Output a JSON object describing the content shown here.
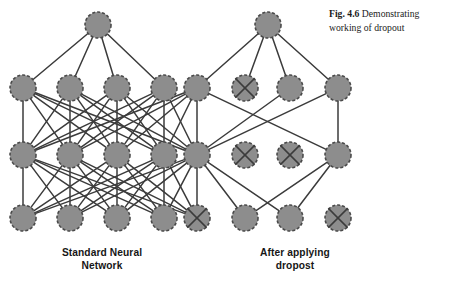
{
  "figure": {
    "caption_label": "Fig. 4.6",
    "caption_text": "Demonstrating working of dropout",
    "left_network_label_line1": "Standard Neural",
    "left_network_label_line2": "Network",
    "right_network_label_line1": "After applying",
    "right_network_label_line2": "dropost"
  },
  "style": {
    "node_fill": "#8d8d8d",
    "node_stroke": "#4a4a4a",
    "edge_color": "#3b3b3b",
    "cross_color": "#3b3b3b",
    "background": "#ffffff",
    "node_radius": 13,
    "node_stroke_width": 1.6,
    "node_dash": "3,2",
    "edge_width": 1.5
  },
  "diagram": {
    "type": "neural-network-dropout",
    "layer_y": {
      "output": 25,
      "hidden2": 88,
      "hidden1": 155,
      "input": 218
    },
    "column_x": [
      23,
      70,
      117,
      164,
      197,
      245,
      290,
      338
    ],
    "nodes": [
      {
        "id": "L-out-1",
        "net": "left",
        "layer": "output",
        "x": 98,
        "y": 25,
        "dropped": false
      },
      {
        "id": "R-out-1",
        "net": "right",
        "layer": "output",
        "x": 268,
        "y": 25,
        "dropped": false
      },
      {
        "id": "L-h2-1",
        "net": "left",
        "layer": "hidden2",
        "x": 23,
        "y": 88,
        "dropped": false
      },
      {
        "id": "L-h2-2",
        "net": "left",
        "layer": "hidden2",
        "x": 70,
        "y": 88,
        "dropped": false
      },
      {
        "id": "L-h2-3",
        "net": "left",
        "layer": "hidden2",
        "x": 117,
        "y": 88,
        "dropped": false
      },
      {
        "id": "L-h2-4",
        "net": "left",
        "layer": "hidden2",
        "x": 164,
        "y": 88,
        "dropped": false
      },
      {
        "id": "S-h2-5",
        "net": "shared",
        "layer": "hidden2",
        "x": 197,
        "y": 88,
        "dropped": false
      },
      {
        "id": "R-h2-2",
        "net": "right",
        "layer": "hidden2",
        "x": 245,
        "y": 88,
        "dropped": true
      },
      {
        "id": "R-h2-3",
        "net": "right",
        "layer": "hidden2",
        "x": 290,
        "y": 88,
        "dropped": false
      },
      {
        "id": "R-h2-4",
        "net": "right",
        "layer": "hidden2",
        "x": 338,
        "y": 88,
        "dropped": false
      },
      {
        "id": "L-h1-1",
        "net": "left",
        "layer": "hidden1",
        "x": 23,
        "y": 155,
        "dropped": false
      },
      {
        "id": "L-h1-2",
        "net": "left",
        "layer": "hidden1",
        "x": 70,
        "y": 155,
        "dropped": false
      },
      {
        "id": "L-h1-3",
        "net": "left",
        "layer": "hidden1",
        "x": 117,
        "y": 155,
        "dropped": false
      },
      {
        "id": "L-h1-4",
        "net": "left",
        "layer": "hidden1",
        "x": 164,
        "y": 155,
        "dropped": false
      },
      {
        "id": "S-h1-5",
        "net": "shared",
        "layer": "hidden1",
        "x": 197,
        "y": 155,
        "dropped": false
      },
      {
        "id": "R-h1-2",
        "net": "right",
        "layer": "hidden1",
        "x": 245,
        "y": 155,
        "dropped": true
      },
      {
        "id": "R-h1-3",
        "net": "right",
        "layer": "hidden1",
        "x": 290,
        "y": 155,
        "dropped": true
      },
      {
        "id": "R-h1-4",
        "net": "right",
        "layer": "hidden1",
        "x": 338,
        "y": 155,
        "dropped": false
      },
      {
        "id": "L-in-1",
        "net": "left",
        "layer": "input",
        "x": 23,
        "y": 218,
        "dropped": false
      },
      {
        "id": "L-in-2",
        "net": "left",
        "layer": "input",
        "x": 70,
        "y": 218,
        "dropped": false
      },
      {
        "id": "L-in-3",
        "net": "left",
        "layer": "input",
        "x": 117,
        "y": 218,
        "dropped": false
      },
      {
        "id": "L-in-4",
        "net": "left",
        "layer": "input",
        "x": 164,
        "y": 218,
        "dropped": false
      },
      {
        "id": "S-in-5",
        "net": "shared",
        "layer": "input",
        "x": 197,
        "y": 218,
        "dropped": true
      },
      {
        "id": "R-in-2",
        "net": "right",
        "layer": "input",
        "x": 245,
        "y": 218,
        "dropped": false
      },
      {
        "id": "R-in-3",
        "net": "right",
        "layer": "input",
        "x": 290,
        "y": 218,
        "dropped": false
      },
      {
        "id": "R-in-4",
        "net": "right",
        "layer": "input",
        "x": 338,
        "y": 218,
        "dropped": true
      }
    ],
    "edges": [
      [
        "L-out-1",
        "L-h2-1"
      ],
      [
        "L-out-1",
        "L-h2-2"
      ],
      [
        "L-out-1",
        "L-h2-3"
      ],
      [
        "L-out-1",
        "L-h2-4"
      ],
      [
        "L-h2-1",
        "L-h1-1"
      ],
      [
        "L-h2-1",
        "L-h1-2"
      ],
      [
        "L-h2-1",
        "L-h1-3"
      ],
      [
        "L-h2-1",
        "L-h1-4"
      ],
      [
        "L-h2-1",
        "S-h1-5"
      ],
      [
        "L-h2-2",
        "L-h1-1"
      ],
      [
        "L-h2-2",
        "L-h1-2"
      ],
      [
        "L-h2-2",
        "L-h1-3"
      ],
      [
        "L-h2-2",
        "L-h1-4"
      ],
      [
        "L-h2-2",
        "S-h1-5"
      ],
      [
        "L-h2-3",
        "L-h1-1"
      ],
      [
        "L-h2-3",
        "L-h1-2"
      ],
      [
        "L-h2-3",
        "L-h1-3"
      ],
      [
        "L-h2-3",
        "L-h1-4"
      ],
      [
        "L-h2-3",
        "S-h1-5"
      ],
      [
        "L-h2-4",
        "L-h1-1"
      ],
      [
        "L-h2-4",
        "L-h1-2"
      ],
      [
        "L-h2-4",
        "L-h1-3"
      ],
      [
        "L-h2-4",
        "L-h1-4"
      ],
      [
        "L-h2-4",
        "S-h1-5"
      ],
      [
        "S-h2-5",
        "L-h1-1"
      ],
      [
        "S-h2-5",
        "L-h1-2"
      ],
      [
        "S-h2-5",
        "L-h1-3"
      ],
      [
        "S-h2-5",
        "L-h1-4"
      ],
      [
        "S-h2-5",
        "S-h1-5"
      ],
      [
        "L-h1-1",
        "L-in-1"
      ],
      [
        "L-h1-1",
        "L-in-2"
      ],
      [
        "L-h1-1",
        "L-in-3"
      ],
      [
        "L-h1-1",
        "L-in-4"
      ],
      [
        "L-h1-1",
        "S-in-5"
      ],
      [
        "L-h1-2",
        "L-in-1"
      ],
      [
        "L-h1-2",
        "L-in-2"
      ],
      [
        "L-h1-2",
        "L-in-3"
      ],
      [
        "L-h1-2",
        "L-in-4"
      ],
      [
        "L-h1-2",
        "S-in-5"
      ],
      [
        "L-h1-3",
        "L-in-1"
      ],
      [
        "L-h1-3",
        "L-in-2"
      ],
      [
        "L-h1-3",
        "L-in-3"
      ],
      [
        "L-h1-3",
        "L-in-4"
      ],
      [
        "L-h1-3",
        "S-in-5"
      ],
      [
        "L-h1-4",
        "L-in-1"
      ],
      [
        "L-h1-4",
        "L-in-2"
      ],
      [
        "L-h1-4",
        "L-in-3"
      ],
      [
        "L-h1-4",
        "L-in-4"
      ],
      [
        "L-h1-4",
        "S-in-5"
      ],
      [
        "S-h1-5",
        "L-in-1"
      ],
      [
        "S-h1-5",
        "L-in-2"
      ],
      [
        "S-h1-5",
        "L-in-3"
      ],
      [
        "S-h1-5",
        "L-in-4"
      ],
      [
        "S-h1-5",
        "S-in-5"
      ],
      [
        "R-out-1",
        "S-h2-5"
      ],
      [
        "R-out-1",
        "R-h2-2"
      ],
      [
        "R-out-1",
        "R-h2-3"
      ],
      [
        "R-out-1",
        "R-h2-4"
      ],
      [
        "S-h2-5",
        "R-h1-4"
      ],
      [
        "R-h2-3",
        "S-h1-5"
      ],
      [
        "R-h2-4",
        "S-h1-5"
      ],
      [
        "R-h2-4",
        "R-h1-4"
      ],
      [
        "S-h1-5",
        "R-in-2"
      ],
      [
        "S-h1-5",
        "R-in-3"
      ],
      [
        "R-h1-4",
        "R-in-2"
      ],
      [
        "R-h1-4",
        "R-in-3"
      ]
    ]
  }
}
